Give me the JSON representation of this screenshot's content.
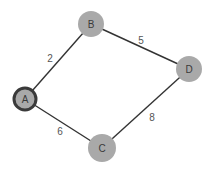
{
  "diagram": {
    "type": "weighted-undirected-graph",
    "colors": {
      "background": "#ffffff",
      "node_fill": "#a9a9a9",
      "start_node_border": "#3a3a3a",
      "edge": "#333333",
      "text": "#3a3a3a"
    },
    "nodes": [
      {
        "id": "A",
        "label": "A",
        "x": 25,
        "y": 99,
        "r": 11,
        "start": true
      },
      {
        "id": "B",
        "label": "B",
        "x": 91,
        "y": 24,
        "r": 13,
        "start": false
      },
      {
        "id": "C",
        "label": "C",
        "x": 102,
        "y": 148,
        "r": 14,
        "start": false
      },
      {
        "id": "D",
        "label": "D",
        "x": 189,
        "y": 69,
        "r": 13,
        "start": false
      }
    ],
    "edges": [
      {
        "from": "A",
        "to": "B",
        "weight": "2",
        "label_x": 50,
        "label_y": 58
      },
      {
        "from": "B",
        "to": "D",
        "weight": "5",
        "label_x": 141,
        "label_y": 40
      },
      {
        "from": "D",
        "to": "C",
        "weight": "8",
        "label_x": 152,
        "label_y": 117
      },
      {
        "from": "A",
        "to": "C",
        "weight": "6",
        "label_x": 60,
        "label_y": 131
      }
    ]
  }
}
